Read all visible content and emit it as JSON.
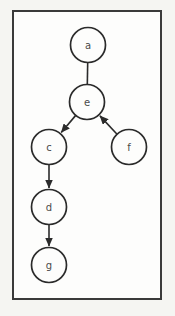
{
  "diagram": {
    "type": "directed-graph",
    "frame": {
      "x": 12,
      "y": 10,
      "width": 150,
      "height": 290
    },
    "colors": {
      "ink": "#2b2b2b",
      "node_fill": "#fdfdfc",
      "page_background": "#f5f5f2",
      "frame_border": "#3a3a3a"
    },
    "node_radius": 17.5,
    "nodes": [
      {
        "id": "a",
        "label": "a",
        "x": 88,
        "y": 45
      },
      {
        "id": "e",
        "label": "e",
        "x": 87,
        "y": 102
      },
      {
        "id": "c",
        "label": "c",
        "x": 49,
        "y": 147
      },
      {
        "id": "f",
        "label": "f",
        "x": 129,
        "y": 147
      },
      {
        "id": "d",
        "label": "d",
        "x": 49,
        "y": 207
      },
      {
        "id": "g",
        "label": "g",
        "x": 49,
        "y": 265
      }
    ],
    "edges": [
      {
        "from": "a",
        "to": "e",
        "directed": false
      },
      {
        "from": "e",
        "to": "c",
        "directed": true
      },
      {
        "from": "f",
        "to": "e",
        "directed": true
      },
      {
        "from": "c",
        "to": "d",
        "directed": true
      },
      {
        "from": "d",
        "to": "g",
        "directed": true
      }
    ]
  }
}
